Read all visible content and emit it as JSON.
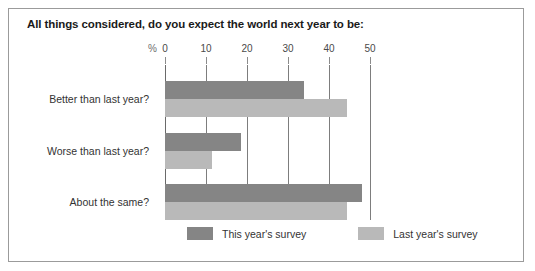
{
  "chart_data": {
    "type": "bar",
    "orientation": "horizontal",
    "title": "All things considered, do you expect the world next year to be:",
    "xlabel": "%",
    "ylabel": "",
    "xlim": [
      0,
      50
    ],
    "xticks": [
      0,
      10,
      20,
      30,
      40,
      50
    ],
    "xtick_labels": [
      "0",
      "10",
      "20",
      "30",
      "40",
      "50"
    ],
    "grid": true,
    "legend_position": "bottom",
    "categories": [
      "Better than last year?",
      "Worse than last year?",
      "About the same?"
    ],
    "series": [
      {
        "name": "This year's survey",
        "color": "#858585",
        "values": [
          34,
          18.5,
          48
        ]
      },
      {
        "name": "Last year's survey",
        "color": "#b9b9b9",
        "values": [
          44.5,
          11.5,
          44.5
        ]
      }
    ]
  },
  "colors": {
    "series_this": "#858585",
    "series_last": "#b9b9b9",
    "frame_border": "#9b9b9b",
    "gridline": "#7d7d7d",
    "title_text": "#1a1a1a",
    "label_text": "#333333",
    "tick_text": "#4a4a4a",
    "percent_text": "#6e6e6e",
    "background": "#ffffff"
  },
  "axis": {
    "percent_symbol": "%",
    "tick_labels": [
      "0",
      "10",
      "20",
      "30",
      "40",
      "50"
    ]
  },
  "legend": {
    "entries": [
      {
        "label": "This year's survey",
        "swatch": "series-this"
      },
      {
        "label": "Last year's survey",
        "swatch": "series-last"
      }
    ]
  }
}
